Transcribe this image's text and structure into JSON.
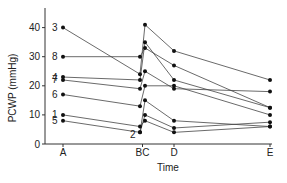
{
  "chart_data": {
    "type": "line",
    "title": "",
    "xlabel": "Time",
    "ylabel": "PCWP (mmHg)",
    "ylim": [
      0,
      45
    ],
    "yticks": [
      0,
      10,
      20,
      30,
      40
    ],
    "categories": [
      "A",
      "B",
      "C",
      "D",
      "E"
    ],
    "xtick_labels": [
      {
        "label": "A",
        "at": "A"
      },
      {
        "label": "BC",
        "at": "B-C"
      },
      {
        "label": "D",
        "at": "D"
      },
      {
        "label": "E",
        "at": "E"
      }
    ],
    "grid": false,
    "legend": "inline series number labels at left of lines",
    "series": [
      {
        "name": "1",
        "values": [
          10,
          6,
          8,
          4,
          6
        ]
      },
      {
        "name": "2",
        "values": [
          null,
          4,
          10,
          5.5,
          7.5
        ]
      },
      {
        "name": "3",
        "values": [
          40,
          24,
          41,
          32,
          22
        ]
      },
      {
        "name": "4",
        "values": [
          23,
          22,
          35,
          22,
          12.5
        ]
      },
      {
        "name": "5",
        "values": [
          8,
          4,
          15,
          8,
          6
        ]
      },
      {
        "name": "6",
        "values": [
          17,
          13,
          20,
          20,
          10
        ]
      },
      {
        "name": "7",
        "values": [
          22,
          19,
          25,
          19,
          18
        ]
      },
      {
        "name": "8",
        "values": [
          30,
          30,
          33,
          27,
          12.5
        ]
      }
    ]
  }
}
